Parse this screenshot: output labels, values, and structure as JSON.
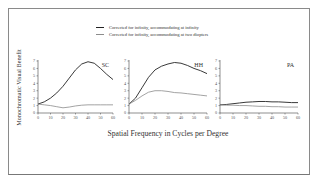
{
  "chart_data": {
    "type": "line",
    "title": "",
    "xlabel": "Spatial Frequency in Cycles per Degree",
    "ylabel": "Monochromatic Visual Benefit",
    "legend": [
      {
        "name": "Corrected for infinity, accommodating at infinity",
        "color": "#222222"
      },
      {
        "name": "Corrected for infinity, accommodating at two diopters",
        "color": "#8c8c8c"
      }
    ],
    "legend_position": "top-center",
    "grid": false,
    "xlim": [
      0,
      60
    ],
    "ylim": [
      0,
      7
    ],
    "xticks": [
      0,
      10,
      20,
      30,
      40,
      50,
      60
    ],
    "yticks": [
      0,
      1,
      2,
      3,
      4,
      5,
      6,
      7
    ],
    "panels": [
      {
        "label": "SC",
        "x": [
          0,
          5,
          10,
          15,
          20,
          25,
          30,
          35,
          40,
          45,
          50,
          55,
          60
        ],
        "series": [
          {
            "name": "Corrected for infinity, accommodating at infinity",
            "values": [
              1.2,
              1.5,
              2.0,
              2.7,
              3.6,
              4.7,
              5.8,
              6.6,
              6.9,
              6.7,
              6.0,
              5.2,
              4.5
            ]
          },
          {
            "name": "Corrected for infinity, accommodating at two diopters",
            "values": [
              1.2,
              1.1,
              1.0,
              0.85,
              0.7,
              0.8,
              0.95,
              1.05,
              1.1,
              1.1,
              1.1,
              1.1,
              1.1
            ]
          }
        ]
      },
      {
        "label": "HH",
        "x": [
          0,
          5,
          10,
          15,
          20,
          25,
          30,
          35,
          40,
          45,
          50,
          55,
          60
        ],
        "series": [
          {
            "name": "Corrected for infinity, accommodating at infinity",
            "values": [
              1.2,
              2.0,
              3.4,
              4.8,
              5.8,
              6.3,
              6.6,
              6.8,
              6.7,
              6.4,
              6.0,
              5.7,
              5.3
            ]
          },
          {
            "name": "Corrected for infinity, accommodating at two diopters",
            "values": [
              1.2,
              1.7,
              2.3,
              2.8,
              3.0,
              3.0,
              2.9,
              2.75,
              2.7,
              2.6,
              2.5,
              2.4,
              2.3
            ]
          }
        ]
      },
      {
        "label": "PA",
        "x": [
          0,
          5,
          10,
          15,
          20,
          25,
          30,
          35,
          40,
          45,
          50,
          55,
          60
        ],
        "series": [
          {
            "name": "Corrected for infinity, accommodating at infinity",
            "values": [
              1.1,
              1.15,
              1.25,
              1.35,
              1.45,
              1.5,
              1.55,
              1.55,
              1.5,
              1.5,
              1.45,
              1.4,
              1.4
            ]
          },
          {
            "name": "Corrected for infinity, accommodating at two diopters",
            "values": [
              1.1,
              1.05,
              1.05,
              1.0,
              1.0,
              0.95,
              0.9,
              0.9,
              0.85,
              0.85,
              0.8,
              0.8,
              0.8
            ]
          }
        ]
      }
    ]
  },
  "legend": {
    "items": [
      {
        "label": "Corrected for infinity, accommodating at infinity",
        "color": "#222222"
      },
      {
        "label": "Corrected for infinity, accommodating at two diopters",
        "color": "#8c8c8c"
      }
    ]
  },
  "axes": {
    "xtitle": "Spatial Frequency in Cycles per Degree",
    "ytitle": "Monochromatic Visual Benefit"
  }
}
